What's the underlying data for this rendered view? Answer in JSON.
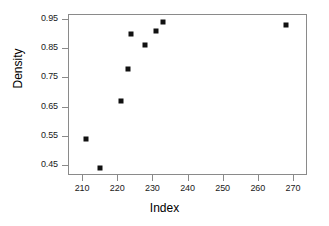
{
  "chart_data": {
    "type": "scatter",
    "title": "",
    "xlabel": "Index",
    "ylabel": "Density",
    "xlim": [
      206,
      274
    ],
    "ylim": [
      0.415,
      0.968
    ],
    "grid": false,
    "legend": null,
    "x_ticks": [
      210,
      220,
      230,
      240,
      250,
      260,
      270
    ],
    "x_tick_labels": [
      "210",
      "220",
      "230",
      "240",
      "250",
      "260",
      "270"
    ],
    "y_ticks": [
      0.45,
      0.55,
      0.65,
      0.75,
      0.85,
      0.95
    ],
    "y_tick_labels": [
      "0.45",
      "0.55",
      "0.65",
      "0.75",
      "0.85",
      "0.95"
    ],
    "marker": "filled-square",
    "marker_color": "#111111",
    "points": [
      {
        "x": 211,
        "y": 0.54
      },
      {
        "x": 215,
        "y": 0.44
      },
      {
        "x": 221,
        "y": 0.67
      },
      {
        "x": 223,
        "y": 0.78
      },
      {
        "x": 224,
        "y": 0.9
      },
      {
        "x": 228,
        "y": 0.86
      },
      {
        "x": 231,
        "y": 0.91
      },
      {
        "x": 233,
        "y": 0.94
      },
      {
        "x": 268,
        "y": 0.93
      }
    ]
  },
  "axes": {
    "frame_color": "#8a8a8a"
  }
}
